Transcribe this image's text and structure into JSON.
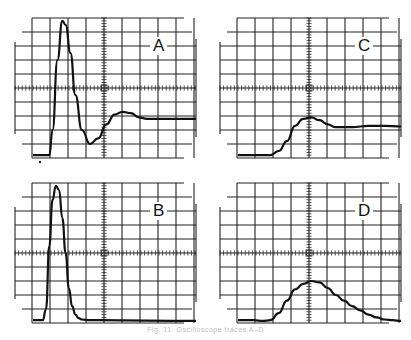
{
  "figure": {
    "caption": "Fig. 11. Oscilloscope traces A–D"
  },
  "panels": [
    {
      "id": "A",
      "label": "A",
      "x": 0,
      "y": 0,
      "marker": true
    },
    {
      "id": "C",
      "label": "C",
      "x": 205,
      "y": 0,
      "marker": false
    },
    {
      "id": "B",
      "label": "B",
      "x": 0,
      "y": 165,
      "marker": false
    },
    {
      "id": "D",
      "label": "D",
      "x": 205,
      "y": 165,
      "marker": false
    }
  ],
  "chart_data": [
    {
      "type": "line",
      "title": "A",
      "grid": true,
      "grid_divisions": {
        "x": 10,
        "y": 10
      },
      "description": "Damped oscillatory response: sharp overshoot then undershoot, settling near -2 div",
      "x": [
        0,
        0.5,
        1.0,
        1.2,
        1.5,
        1.8,
        2.0,
        2.3,
        2.6,
        3.0,
        3.5,
        4.0,
        4.5,
        5.0,
        5.5,
        6.0,
        6.5,
        7.0,
        8.0,
        9.0,
        10.0
      ],
      "y": [
        -4.8,
        -4.8,
        -4.8,
        -3.0,
        2.0,
        4.8,
        4.5,
        2.5,
        -0.5,
        -3.0,
        -4.0,
        -3.6,
        -2.6,
        -1.9,
        -1.7,
        -1.8,
        -2.1,
        -2.2,
        -2.2,
        -2.2,
        -2.2
      ]
    },
    {
      "type": "line",
      "title": "C",
      "grid": true,
      "grid_divisions": {
        "x": 10,
        "y": 10
      },
      "description": "Slow rising step with small overshoot, settling near -2.7 div",
      "x": [
        0,
        1.0,
        2.0,
        2.5,
        3.0,
        3.5,
        4.0,
        4.5,
        5.0,
        5.5,
        6.0,
        7.0,
        8.0,
        9.0,
        10.0
      ],
      "y": [
        -4.8,
        -4.8,
        -4.8,
        -4.5,
        -3.8,
        -2.7,
        -2.2,
        -2.1,
        -2.3,
        -2.6,
        -2.8,
        -2.8,
        -2.7,
        -2.7,
        -2.75
      ]
    },
    {
      "type": "line",
      "title": "B",
      "grid": true,
      "grid_divisions": {
        "x": 10,
        "y": 10
      },
      "description": "Narrow single pulse rising to full scale, returning to baseline",
      "x": [
        0,
        0.6,
        0.8,
        1.0,
        1.2,
        1.4,
        1.6,
        1.8,
        2.0,
        2.2,
        2.4,
        2.6,
        2.8,
        3.0,
        3.5,
        4.0,
        10.0
      ],
      "y": [
        -4.8,
        -4.8,
        -4.0,
        0.5,
        3.8,
        4.8,
        4.5,
        2.5,
        0,
        -2.5,
        -3.8,
        -4.4,
        -4.65,
        -4.75,
        -4.8,
        -4.8,
        -4.85
      ]
    },
    {
      "type": "line",
      "title": "D",
      "grid": true,
      "grid_divisions": {
        "x": 10,
        "y": 10
      },
      "description": "Broad smooth pulse peaking about 2 div at center, long trailing decay",
      "x": [
        0,
        1.0,
        1.5,
        2.0,
        2.5,
        3.0,
        3.5,
        4.0,
        4.5,
        5.0,
        5.5,
        6.0,
        6.5,
        7.0,
        7.5,
        8.0,
        8.5,
        9.0,
        9.5,
        10.0
      ],
      "y": [
        -4.8,
        -4.8,
        -4.85,
        -4.8,
        -4.3,
        -3.4,
        -2.6,
        -2.2,
        -2.0,
        -2.1,
        -2.5,
        -3.0,
        -3.4,
        -3.8,
        -4.1,
        -4.4,
        -4.6,
        -4.75,
        -4.8,
        -4.85
      ]
    }
  ]
}
